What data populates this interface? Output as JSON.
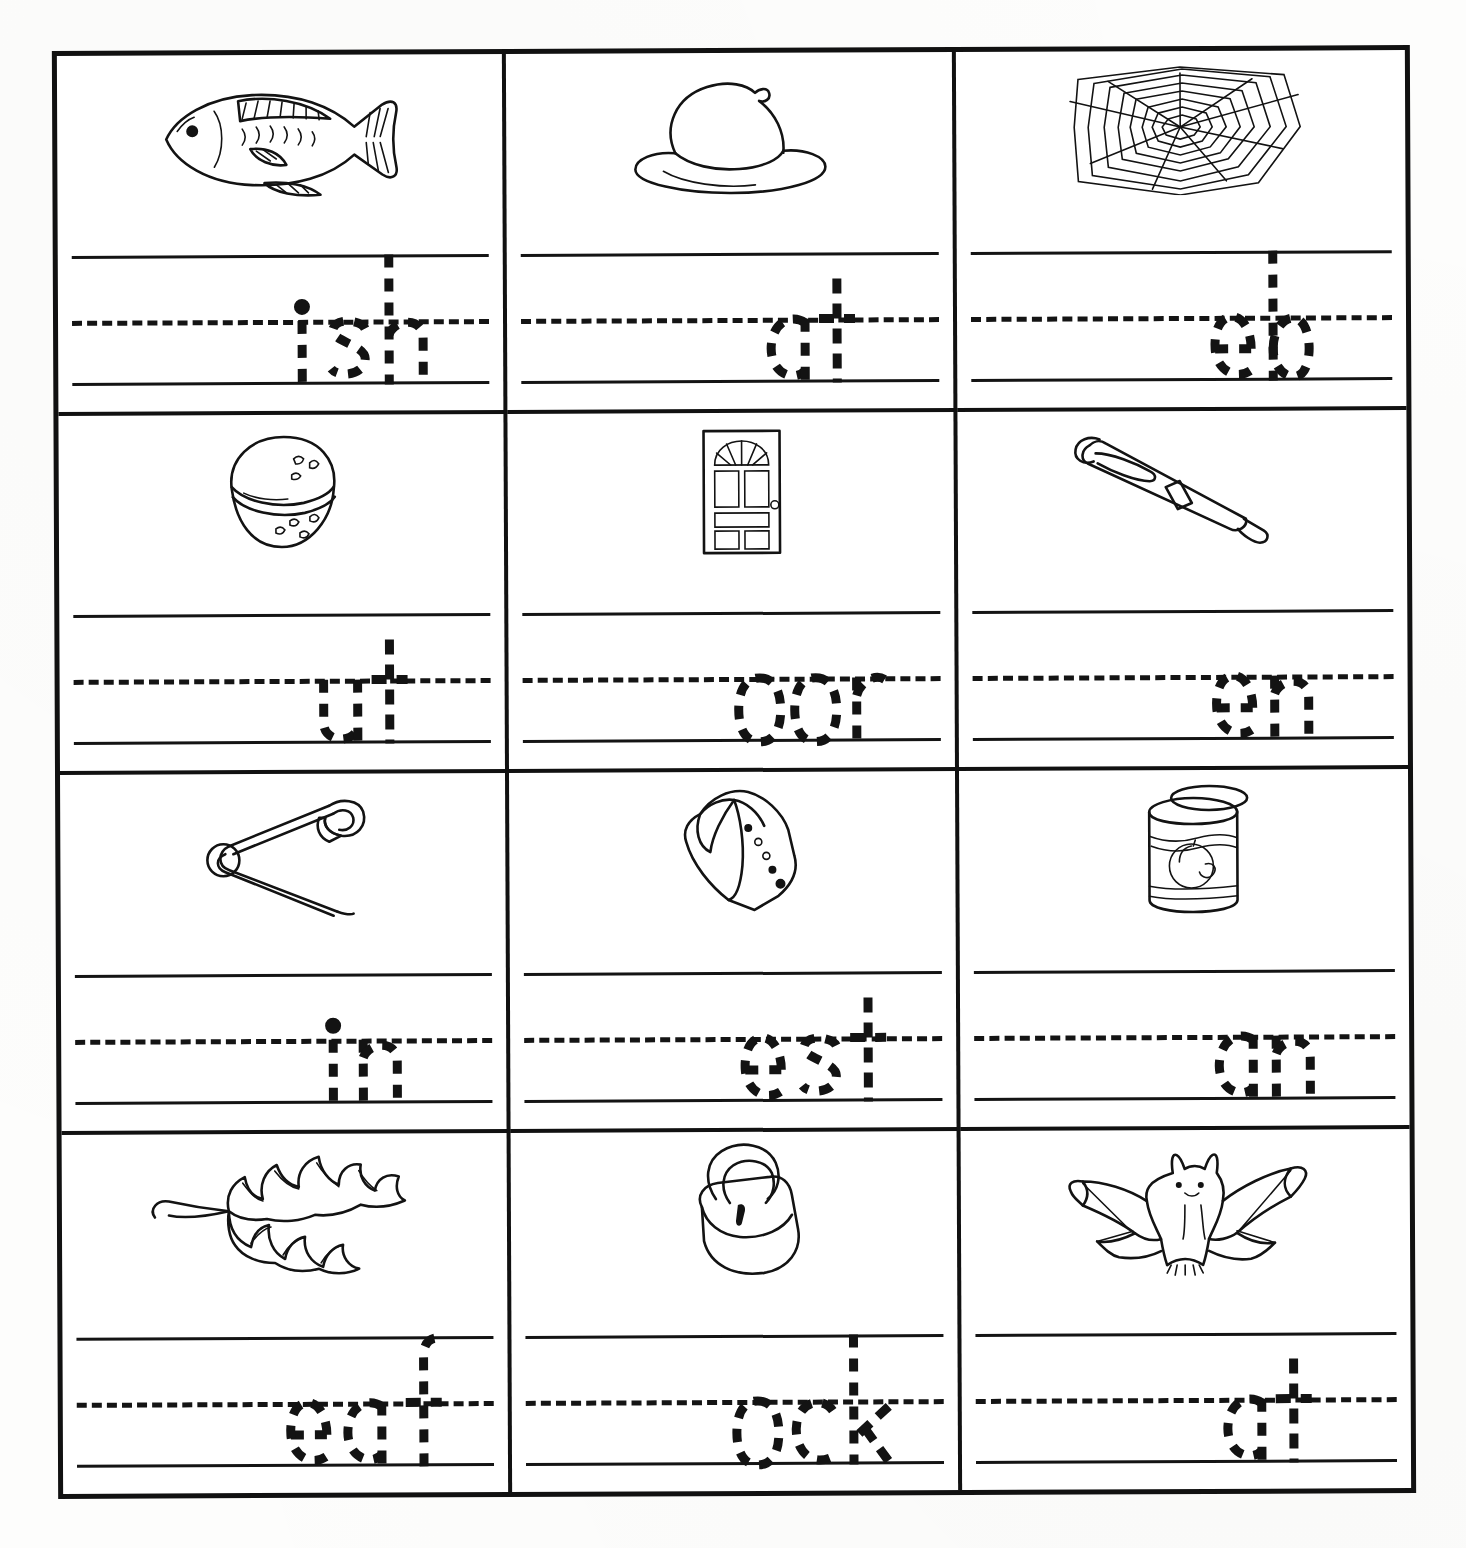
{
  "worksheet": {
    "title": "Beginning Sounds Handwriting Worksheet",
    "type": "phonics-tracing-grid",
    "rows": 4,
    "columns": 3,
    "ink_color": "#131313",
    "paper_color": "#ffffff"
  },
  "cells": [
    {
      "index": 1,
      "row": 1,
      "column": 1,
      "picture": "fish-illustration",
      "picture_label": "fish",
      "answer_word": "fish",
      "missing_letter": "f",
      "traced_text": "ish",
      "letters": [
        {
          "char": "i",
          "style": "x-height-dotted",
          "has_dot": true
        },
        {
          "char": "s",
          "style": "x-height-dotted"
        },
        {
          "char": "h",
          "style": "ascender-dotted"
        }
      ]
    },
    {
      "index": 2,
      "row": 1,
      "column": 2,
      "picture": "hat-illustration",
      "picture_label": "hat",
      "answer_word": "hat",
      "missing_letter": "h",
      "traced_text": "at",
      "letters": [
        {
          "char": "a",
          "style": "x-height-dotted"
        },
        {
          "char": "t",
          "style": "tall-dotted"
        }
      ]
    },
    {
      "index": 3,
      "row": 1,
      "column": 3,
      "picture": "spider-web-illustration",
      "picture_label": "web",
      "answer_word": "web",
      "missing_letter": "w",
      "traced_text": "eb",
      "letters": [
        {
          "char": "e",
          "style": "x-height-dotted"
        },
        {
          "char": "b",
          "style": "ascender-dotted"
        }
      ]
    },
    {
      "index": 4,
      "row": 2,
      "column": 1,
      "picture": "nut-illustration",
      "picture_label": "nut",
      "answer_word": "nut",
      "missing_letter": "n",
      "traced_text": "ut",
      "letters": [
        {
          "char": "u",
          "style": "x-height-dotted"
        },
        {
          "char": "t",
          "style": "tall-dotted"
        }
      ]
    },
    {
      "index": 5,
      "row": 2,
      "column": 2,
      "picture": "door-illustration",
      "picture_label": "door",
      "answer_word": "door",
      "missing_letter": "d",
      "traced_text": "oor",
      "letters": [
        {
          "char": "o",
          "style": "x-height-dotted"
        },
        {
          "char": "o",
          "style": "x-height-dotted"
        },
        {
          "char": "r",
          "style": "x-height-dotted"
        }
      ]
    },
    {
      "index": 6,
      "row": 2,
      "column": 3,
      "picture": "pen-illustration",
      "picture_label": "pen",
      "answer_word": "pen",
      "missing_letter": "p",
      "traced_text": "en",
      "letters": [
        {
          "char": "e",
          "style": "x-height-dotted"
        },
        {
          "char": "n",
          "style": "x-height-dotted"
        }
      ]
    },
    {
      "index": 7,
      "row": 3,
      "column": 1,
      "picture": "safety-pin-illustration",
      "picture_label": "pin",
      "answer_word": "pin",
      "missing_letter": "p",
      "traced_text": "in",
      "letters": [
        {
          "char": "i",
          "style": "x-height-dotted",
          "has_dot": true
        },
        {
          "char": "n",
          "style": "x-height-dotted"
        }
      ]
    },
    {
      "index": 8,
      "row": 3,
      "column": 2,
      "picture": "vest-illustration",
      "picture_label": "vest",
      "answer_word": "vest",
      "missing_letter": "v",
      "traced_text": "est",
      "letters": [
        {
          "char": "e",
          "style": "x-height-dotted"
        },
        {
          "char": "s",
          "style": "x-height-dotted"
        },
        {
          "char": "t",
          "style": "tall-dotted"
        }
      ]
    },
    {
      "index": 9,
      "row": 3,
      "column": 3,
      "picture": "can-illustration",
      "picture_label": "can",
      "answer_word": "can",
      "missing_letter": "c",
      "traced_text": "an",
      "letters": [
        {
          "char": "a",
          "style": "x-height-dotted"
        },
        {
          "char": "n",
          "style": "x-height-dotted"
        }
      ]
    },
    {
      "index": 10,
      "row": 4,
      "column": 1,
      "picture": "leaf-illustration",
      "picture_label": "leaf",
      "answer_word": "leaf",
      "missing_letter": "l",
      "traced_text": "eaf",
      "letters": [
        {
          "char": "e",
          "style": "x-height-dotted"
        },
        {
          "char": "a",
          "style": "x-height-dotted"
        },
        {
          "char": "f",
          "style": "ascender-dotted"
        }
      ]
    },
    {
      "index": 11,
      "row": 4,
      "column": 2,
      "picture": "padlock-illustration",
      "picture_label": "lock",
      "answer_word": "lock",
      "missing_letter": "l",
      "traced_text": "ock",
      "letters": [
        {
          "char": "o",
          "style": "x-height-dotted"
        },
        {
          "char": "c",
          "style": "x-height-dotted"
        },
        {
          "char": "k",
          "style": "ascender-dotted"
        }
      ]
    },
    {
      "index": 12,
      "row": 4,
      "column": 3,
      "picture": "bat-illustration",
      "picture_label": "bat",
      "answer_word": "bat",
      "missing_letter": "b",
      "traced_text": "at",
      "letters": [
        {
          "char": "a",
          "style": "x-height-dotted"
        },
        {
          "char": "t",
          "style": "tall-dotted"
        }
      ]
    }
  ]
}
